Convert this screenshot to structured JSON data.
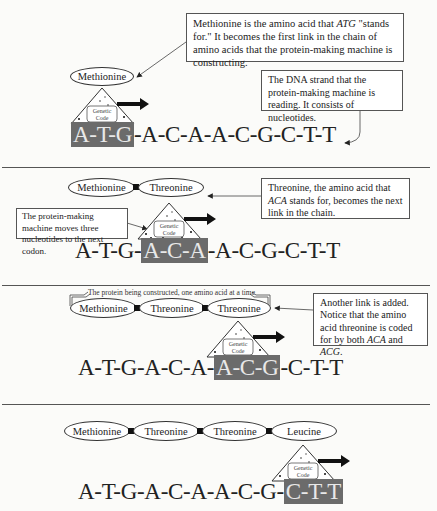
{
  "machine": {
    "label_line1": "Genetic",
    "label_line2": "Code"
  },
  "panels": [
    {
      "amino_acids": [
        "Methionine"
      ],
      "sequence": {
        "before": "",
        "codon": "A-T-G",
        "after": "-A-C-A-A-C-G-C-T-T"
      },
      "callouts": [
        {
          "text_parts": [
            "Methionine is the amino acid that ",
            "ATG",
            " \"stands for.\" It becomes the first link in the chain of amino acids that the protein-making machine is constructing."
          ]
        },
        {
          "text": "The DNA strand that the protein-making machine is reading. It consists of nucleotides."
        }
      ]
    },
    {
      "amino_acids": [
        "Methionine",
        "Threonine"
      ],
      "sequence": {
        "before": "A-T-G-",
        "codon": "A-C-A",
        "after": "-A-C-G-C-T-T"
      },
      "callouts": [
        {
          "text_parts": [
            "Threonine, the amino acid that ",
            "ACA",
            " stands for, becomes the next link in the chain."
          ]
        },
        {
          "text": "The protein-making machine moves three nucleotides to the next codon."
        }
      ]
    },
    {
      "amino_acids": [
        "Methionine",
        "Threonine",
        "Threonine"
      ],
      "bracket_label": "The protein being constructed, one amino acid at a time",
      "sequence": {
        "before": "A-T-G-A-C-A-",
        "codon": "A-C-G",
        "after": "-C-T-T"
      },
      "callouts": [
        {
          "text_parts": [
            "Another link is added. Notice that the amino acid threonine is coded for by both ",
            "ACA",
            " and ",
            "ACG",
            "."
          ]
        }
      ]
    },
    {
      "amino_acids": [
        "Methionine",
        "Threonine",
        "Threonine",
        "Leucine"
      ],
      "sequence": {
        "before": "A-T-G-A-C-A-A-C-G-",
        "codon": "C-T-T",
        "after": ""
      }
    }
  ],
  "colors": {
    "codon_highlight": "#6b6b6b",
    "divider": "#555555",
    "link": "#111111"
  }
}
